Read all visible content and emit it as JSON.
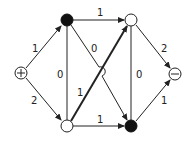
{
  "diagram": {
    "type": "flow-network",
    "nodes": [
      {
        "id": "source",
        "label": "+",
        "fill": "white",
        "x": 21,
        "y": 73
      },
      {
        "id": "a",
        "label": "",
        "fill": "black",
        "x": 67,
        "y": 20
      },
      {
        "id": "b",
        "label": "",
        "fill": "white",
        "x": 67,
        "y": 126
      },
      {
        "id": "c",
        "label": "",
        "fill": "white",
        "x": 131,
        "y": 20
      },
      {
        "id": "d",
        "label": "",
        "fill": "black",
        "x": 131,
        "y": 126
      },
      {
        "id": "sink",
        "label": "−",
        "fill": "white",
        "x": 175,
        "y": 74
      }
    ],
    "edges": [
      {
        "from": "source",
        "to": "a",
        "label": "1"
      },
      {
        "from": "source",
        "to": "b",
        "label": "2"
      },
      {
        "from": "a",
        "to": "c",
        "label": "1"
      },
      {
        "from": "a",
        "to": "b",
        "label": "0"
      },
      {
        "from": "a",
        "to": "d",
        "label": "0"
      },
      {
        "from": "b",
        "to": "c",
        "label": "1",
        "emphasis": "thick"
      },
      {
        "from": "b",
        "to": "d",
        "label": "1"
      },
      {
        "from": "c",
        "to": "d",
        "label": "0"
      },
      {
        "from": "c",
        "to": "sink",
        "label": "2"
      },
      {
        "from": "d",
        "to": "sink",
        "label": "1"
      }
    ]
  },
  "labels": {
    "source": "+",
    "sink": "−",
    "e_s_a": "1",
    "e_s_b": "2",
    "e_a_c": "1",
    "e_a_b": "0",
    "e_a_d": "0",
    "e_b_c": "1",
    "e_b_d": "1",
    "e_c_d": "0",
    "e_c_t": "2",
    "e_d_t": "1"
  }
}
